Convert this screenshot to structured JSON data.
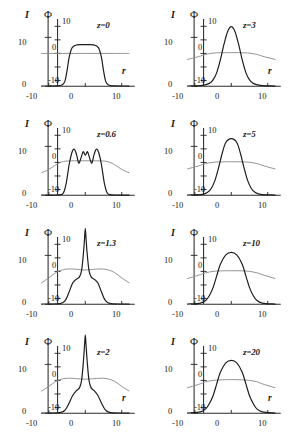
{
  "figure": {
    "axis_labels": {
      "intensity": "I",
      "phase": "Φ",
      "radial": "r"
    },
    "shared": {
      "x_ticks": [
        "-10",
        "0",
        "10"
      ],
      "i_ticks": [
        "0",
        "10"
      ],
      "phi_ticks": [
        "-10",
        "0",
        "10"
      ],
      "x_range": [
        -12,
        12
      ],
      "i_range": [
        0,
        14
      ],
      "phi_range": [
        -12,
        12
      ]
    },
    "colors": {
      "intensity_curve": "#1d1d1d",
      "phase_curve": "#8d8d8d",
      "axis": "#2b2b2b"
    }
  },
  "chart_data": {
    "type": "line",
    "title": "",
    "xlabel": "r",
    "ylabel": "I",
    "y2label": "Φ",
    "xlim": [
      -12,
      12
    ],
    "ylim": [
      0,
      14
    ],
    "y2lim": [
      -12,
      12
    ],
    "grid": false,
    "legend": "none",
    "panels": [
      {
        "id": "z0",
        "label": "z=0",
        "row": 0,
        "col": 0,
        "show_r_label": true,
        "series": [
          {
            "name": "I",
            "note": "flat-top super-gaussian beam profile, plateau value ~8.5",
            "x": [
              -12,
              -8,
              -6.4,
              -5.6,
              -5.0,
              -4.4,
              -3.6,
              -2.4,
              0,
              2.4,
              3.6,
              4.4,
              5.0,
              5.6,
              6.4,
              8,
              12
            ],
            "y": [
              0.05,
              0.1,
              0.25,
              1.0,
              3.2,
              6.0,
              7.9,
              8.45,
              8.5,
              8.45,
              7.9,
              6.0,
              3.2,
              1.0,
              0.25,
              0.1,
              0.05
            ]
          },
          {
            "name": "Φ",
            "note": "near-flat phase, essentially zero across aperture",
            "x": [
              -12,
              -8,
              -4,
              0,
              4,
              8,
              12
            ],
            "y": [
              0.0,
              0.0,
              0.0,
              0.0,
              0.0,
              0.0,
              0.0
            ]
          }
        ]
      },
      {
        "id": "z3",
        "label": "z=3",
        "row": 0,
        "col": 1,
        "show_r_label": true,
        "series": [
          {
            "name": "I",
            "note": "narrow bell peak, max ~12.2 at r=0",
            "x": [
              -12,
              -8,
              -6,
              -5,
              -4,
              -3,
              -2,
              -1,
              0,
              1,
              2,
              3,
              4,
              5,
              6,
              8,
              12
            ],
            "y": [
              0.05,
              0.2,
              0.6,
              1.3,
              2.8,
              5.4,
              8.6,
              11.2,
              12.2,
              11.2,
              8.6,
              5.4,
              2.8,
              1.3,
              0.6,
              0.2,
              0.05
            ]
          },
          {
            "name": "Φ",
            "note": "broad shallow dome, slight droop at wings",
            "x": [
              -12,
              -9,
              -7,
              -5,
              -3,
              0,
              3,
              5,
              7,
              9,
              12
            ],
            "y": [
              -2.2,
              -1.2,
              -0.35,
              0.1,
              0.25,
              0.3,
              0.25,
              0.1,
              -0.35,
              -1.2,
              -2.2
            ]
          }
        ]
      },
      {
        "id": "z06",
        "label": "z=0.6",
        "row": 1,
        "col": 0,
        "show_r_label": false,
        "series": [
          {
            "name": "I",
            "note": "flat-top with three ripple peaks forming on plateau",
            "x": [
              -12,
              -7.2,
              -6.0,
              -5.2,
              -4.4,
              -3.6,
              -3.0,
              -2.4,
              -1.8,
              -1.2,
              -0.6,
              0,
              0.6,
              1.2,
              1.8,
              2.4,
              3.0,
              3.6,
              4.4,
              5.2,
              6.0,
              7.2,
              12
            ],
            "y": [
              0.05,
              0.1,
              0.5,
              2.6,
              6.4,
              8.9,
              9.4,
              8.3,
              6.6,
              7.6,
              8.9,
              8.2,
              8.9,
              7.6,
              6.6,
              8.3,
              9.4,
              8.9,
              6.4,
              2.6,
              0.5,
              0.1,
              0.05
            ]
          },
          {
            "name": "Φ",
            "note": "broad dome spanning full aperture, peak ~0.6",
            "x": [
              -12,
              -10,
              -8,
              -6,
              -3,
              0,
              3,
              6,
              8,
              10,
              12
            ],
            "y": [
              -3.8,
              -2.6,
              -0.8,
              0.35,
              0.6,
              0.6,
              0.6,
              0.35,
              -0.8,
              -2.6,
              -3.8
            ]
          }
        ]
      },
      {
        "id": "z5",
        "label": "z=5",
        "row": 1,
        "col": 1,
        "show_r_label": false,
        "series": [
          {
            "name": "I",
            "note": "smooth bell, peak ~11.6, slightly wider than z=3",
            "x": [
              -12,
              -8,
              -6.5,
              -5.5,
              -4.5,
              -3.5,
              -2.5,
              -1.5,
              0,
              1.5,
              2.5,
              3.5,
              4.5,
              5.5,
              6.5,
              8,
              12
            ],
            "y": [
              0.05,
              0.2,
              0.6,
              1.4,
              3.0,
              5.6,
              8.6,
              10.8,
              11.6,
              10.8,
              8.6,
              5.6,
              3.0,
              1.4,
              0.6,
              0.2,
              0.05
            ]
          },
          {
            "name": "Φ",
            "note": "broad shallow dome with drooping wings",
            "x": [
              -12,
              -9,
              -7,
              -5,
              -3,
              0,
              3,
              5,
              7,
              9,
              12
            ],
            "y": [
              -2.4,
              -1.3,
              -0.4,
              0.05,
              0.2,
              0.25,
              0.2,
              0.05,
              -0.4,
              -1.3,
              -2.4
            ]
          }
        ]
      },
      {
        "id": "z13",
        "label": "z=1.3",
        "row": 2,
        "col": 0,
        "show_r_label": false,
        "series": [
          {
            "name": "I",
            "note": "sharp self-focused spike clipped above frame, pedestal ~5",
            "x": [
              -12,
              -7,
              -5.5,
              -4.5,
              -3.5,
              -2.5,
              -1.6,
              -1.0,
              -0.5,
              -0.2,
              0,
              0.2,
              0.5,
              1.0,
              1.6,
              2.5,
              3.5,
              4.5,
              5.5,
              7,
              12
            ],
            "y": [
              0.05,
              0.15,
              0.8,
              2.4,
              4.3,
              5.1,
              5.6,
              7.0,
              10.5,
              13.5,
              15.5,
              13.5,
              10.5,
              7.0,
              5.6,
              5.1,
              4.3,
              2.4,
              0.8,
              0.15,
              0.05
            ]
          },
          {
            "name": "Φ",
            "note": "wide dome with small central dip",
            "x": [
              -12,
              -10,
              -8,
              -6,
              -4,
              -2,
              0,
              2,
              4,
              6,
              8,
              10,
              12
            ],
            "y": [
              -4.2,
              -2.4,
              -0.4,
              0.7,
              0.9,
              0.75,
              0.5,
              0.75,
              0.9,
              0.7,
              -0.4,
              -2.4,
              -4.2
            ]
          }
        ]
      },
      {
        "id": "z10",
        "label": "z=10",
        "row": 2,
        "col": 1,
        "show_r_label": false,
        "series": [
          {
            "name": "I",
            "note": "broad smooth bell, peak ~10.6",
            "x": [
              -12,
              -8.5,
              -7,
              -6,
              -5,
              -4,
              -3,
              -1.5,
              0,
              1.5,
              3,
              4,
              5,
              6,
              7,
              8.5,
              12
            ],
            "y": [
              0.05,
              0.25,
              0.8,
              1.8,
              3.4,
              5.8,
              8.2,
              10.1,
              10.6,
              10.1,
              8.2,
              5.8,
              3.4,
              1.8,
              0.8,
              0.25,
              0.05
            ]
          },
          {
            "name": "Φ",
            "note": "broad shallow dome",
            "x": [
              -12,
              -9,
              -7,
              -5,
              -3,
              0,
              3,
              5,
              7,
              9,
              12
            ],
            "y": [
              -2.6,
              -1.4,
              -0.5,
              0.0,
              0.2,
              0.25,
              0.2,
              0.0,
              -0.5,
              -1.4,
              -2.6
            ]
          }
        ]
      },
      {
        "id": "z2",
        "label": "z=2",
        "row": 3,
        "col": 0,
        "show_r_label": true,
        "series": [
          {
            "name": "I",
            "note": "very narrow tall spike clipped above frame, low wings",
            "x": [
              -12,
              -7,
              -5.5,
              -4.5,
              -3.5,
              -2.5,
              -1.6,
              -1.0,
              -0.5,
              -0.2,
              0,
              0.2,
              0.5,
              1.0,
              1.6,
              2.5,
              3.5,
              4.5,
              5.5,
              7,
              12
            ],
            "y": [
              0.05,
              0.15,
              0.7,
              2.0,
              3.6,
              4.6,
              5.2,
              6.8,
              10.8,
              14.0,
              16.0,
              14.0,
              10.8,
              6.8,
              5.2,
              4.6,
              3.6,
              2.0,
              0.7,
              0.15,
              0.05
            ]
          },
          {
            "name": "Φ",
            "note": "wide dome with shallow central dip, peak ~0.8",
            "x": [
              -12,
              -10,
              -8,
              -6,
              -4,
              -2,
              0,
              2,
              4,
              6,
              8,
              10,
              12
            ],
            "y": [
              -3.9,
              -2.2,
              -0.3,
              0.65,
              0.8,
              0.6,
              0.45,
              0.6,
              0.8,
              0.65,
              -0.3,
              -2.2,
              -3.9
            ]
          }
        ]
      },
      {
        "id": "z20",
        "label": "z=20",
        "row": 3,
        "col": 1,
        "show_r_label": true,
        "series": [
          {
            "name": "I",
            "note": "broad smooth bell, peak ~10.8, widest of the series",
            "x": [
              -12,
              -8.5,
              -7,
              -6,
              -5,
              -4,
              -3,
              -1.5,
              0,
              1.5,
              3,
              4,
              5,
              6,
              7,
              8.5,
              12
            ],
            "y": [
              0.05,
              0.3,
              0.9,
              2.0,
              3.6,
              6.0,
              8.4,
              10.3,
              10.8,
              10.3,
              8.4,
              6.0,
              3.6,
              2.0,
              0.9,
              0.3,
              0.05
            ]
          },
          {
            "name": "Φ",
            "note": "broad shallow dome with drooping wings",
            "x": [
              -12,
              -9,
              -7,
              -5,
              -3,
              0,
              3,
              5,
              7,
              9,
              12
            ],
            "y": [
              -2.7,
              -1.5,
              -0.5,
              0.0,
              0.2,
              0.3,
              0.2,
              0.0,
              -0.5,
              -1.5,
              -2.7
            ]
          }
        ]
      }
    ]
  }
}
